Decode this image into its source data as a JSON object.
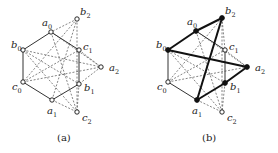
{
  "figure": {
    "panels": [
      {
        "id": "a",
        "caption": "(a)",
        "caption_pos": [
          57,
          141
        ],
        "nodes": [
          {
            "id": "a0",
            "base": "a",
            "sub": "0",
            "x": 51,
            "y": 32,
            "filled": false,
            "lx": 42,
            "ly": 26
          },
          {
            "id": "b2",
            "base": "b",
            "sub": "2",
            "x": 77,
            "y": 19,
            "filled": false,
            "lx": 80,
            "ly": 15
          },
          {
            "id": "b0",
            "base": "b",
            "sub": "0",
            "x": 23,
            "y": 50,
            "filled": false,
            "lx": 11,
            "ly": 48
          },
          {
            "id": "c1",
            "base": "c",
            "sub": "1",
            "x": 79,
            "y": 50,
            "filled": false,
            "lx": 83,
            "ly": 50
          },
          {
            "id": "a2",
            "base": "a",
            "sub": "2",
            "x": 101,
            "y": 67,
            "filled": false,
            "lx": 109,
            "ly": 71
          },
          {
            "id": "c0",
            "base": "c",
            "sub": "0",
            "x": 23,
            "y": 82,
            "filled": false,
            "lx": 12,
            "ly": 90
          },
          {
            "id": "b1",
            "base": "b",
            "sub": "1",
            "x": 79,
            "y": 84,
            "filled": false,
            "lx": 84,
            "ly": 91
          },
          {
            "id": "a1",
            "base": "a",
            "sub": "1",
            "x": 52,
            "y": 100,
            "filled": false,
            "lx": 47,
            "ly": 114
          },
          {
            "id": "c2",
            "base": "c",
            "sub": "2",
            "x": 77,
            "y": 112,
            "filled": false,
            "lx": 82,
            "ly": 121
          }
        ],
        "solid_edges": [
          [
            "a0",
            "b0"
          ],
          [
            "b0",
            "c0"
          ],
          [
            "c0",
            "a1"
          ],
          [
            "a1",
            "b1"
          ],
          [
            "b1",
            "c1"
          ],
          [
            "c1",
            "a0"
          ]
        ],
        "bold_edges": [],
        "dashed_edges": [
          [
            "b2",
            "a0"
          ],
          [
            "b2",
            "c0"
          ],
          [
            "b2",
            "a1"
          ],
          [
            "b2",
            "c2"
          ],
          [
            "a0",
            "a2"
          ],
          [
            "a0",
            "c2"
          ],
          [
            "b0",
            "a2"
          ],
          [
            "b0",
            "b1"
          ],
          [
            "b0",
            "c2"
          ],
          [
            "c0",
            "a2"
          ],
          [
            "c0",
            "c1"
          ],
          [
            "c1",
            "a2"
          ],
          [
            "a2",
            "b1"
          ],
          [
            "a1",
            "c2"
          ],
          [
            "b1",
            "c2"
          ]
        ]
      },
      {
        "id": "b",
        "caption": "(b)",
        "caption_pos": [
          202,
          141
        ],
        "nodes": [
          {
            "id": "a0",
            "base": "a",
            "sub": "0",
            "x": 196,
            "y": 31,
            "filled": true,
            "lx": 187,
            "ly": 25
          },
          {
            "id": "b2",
            "base": "b",
            "sub": "2",
            "x": 222,
            "y": 18,
            "filled": true,
            "lx": 225,
            "ly": 14
          },
          {
            "id": "b0",
            "base": "b",
            "sub": "0",
            "x": 168,
            "y": 50,
            "filled": true,
            "lx": 156,
            "ly": 48
          },
          {
            "id": "c1",
            "base": "c",
            "sub": "1",
            "x": 225,
            "y": 50,
            "filled": false,
            "lx": 229,
            "ly": 50
          },
          {
            "id": "a2",
            "base": "a",
            "sub": "2",
            "x": 247,
            "y": 67,
            "filled": true,
            "lx": 255,
            "ly": 71
          },
          {
            "id": "c0",
            "base": "c",
            "sub": "0",
            "x": 168,
            "y": 82,
            "filled": false,
            "lx": 157,
            "ly": 90
          },
          {
            "id": "b1",
            "base": "b",
            "sub": "1",
            "x": 225,
            "y": 83,
            "filled": true,
            "lx": 230,
            "ly": 90
          },
          {
            "id": "a1",
            "base": "a",
            "sub": "1",
            "x": 197,
            "y": 100,
            "filled": true,
            "lx": 192,
            "ly": 114
          },
          {
            "id": "c2",
            "base": "c",
            "sub": "2",
            "x": 222,
            "y": 112,
            "filled": false,
            "lx": 227,
            "ly": 121
          }
        ],
        "solid_edges": [
          [
            "b0",
            "c0"
          ],
          [
            "c0",
            "a1"
          ],
          [
            "a0",
            "c1"
          ],
          [
            "c1",
            "b1"
          ]
        ],
        "bold_edges": [
          [
            "b0",
            "a0"
          ],
          [
            "a0",
            "b2"
          ],
          [
            "b2",
            "a1"
          ],
          [
            "a1",
            "b1"
          ],
          [
            "b1",
            "a2"
          ],
          [
            "a2",
            "b0"
          ]
        ],
        "dashed_edges": [
          [
            "b2",
            "c0"
          ],
          [
            "b2",
            "c2"
          ],
          [
            "b2",
            "c1"
          ],
          [
            "a0",
            "a2"
          ],
          [
            "a0",
            "c2"
          ],
          [
            "b0",
            "b1"
          ],
          [
            "b0",
            "c2"
          ],
          [
            "c0",
            "a2"
          ],
          [
            "c0",
            "c1"
          ],
          [
            "c1",
            "a2"
          ],
          [
            "a1",
            "c2"
          ],
          [
            "b1",
            "c2"
          ]
        ]
      }
    ],
    "colors": {
      "stroke": "#333333",
      "bold": "#111111",
      "dashed": "#666666",
      "node_fill_open": "#ffffff",
      "node_fill_solid": "#111111"
    }
  }
}
